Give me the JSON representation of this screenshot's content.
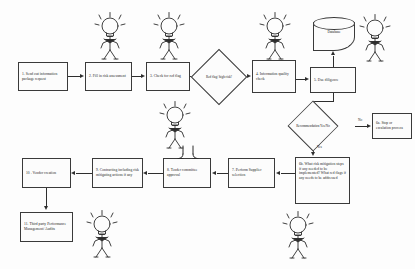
{
  "diagram": {
    "background": "#fdfdfd",
    "line_color": "#2e2e2e",
    "box_fill": "#fcfcfc",
    "nodes": [
      {
        "id": "n1",
        "label": "1. Send out information package request",
        "shape": "rect",
        "x": 18,
        "y": 62,
        "w": 50,
        "h": 29
      },
      {
        "id": "n2",
        "label": "2. Fill in risk assessment",
        "shape": "rect",
        "x": 85,
        "y": 62,
        "w": 47,
        "h": 29
      },
      {
        "id": "n3",
        "label": "3. Check for red flag",
        "shape": "rect",
        "x": 146,
        "y": 62,
        "w": 44,
        "h": 29
      },
      {
        "id": "d1",
        "label": "Red flag/ high risk?",
        "shape": "diamond",
        "x": 199,
        "y": 57,
        "w": 40,
        "h": 40
      },
      {
        "id": "n4",
        "label": "4. Information quality check",
        "shape": "rect",
        "x": 252,
        "y": 60,
        "w": 44,
        "h": 33
      },
      {
        "id": "n5",
        "label": "5. Due diligence",
        "shape": "rect",
        "x": 310,
        "y": 67,
        "w": 46,
        "h": 26
      },
      {
        "id": "db",
        "label": "Database",
        "shape": "cylinder",
        "x": 313,
        "y": 17,
        "w": 42,
        "h": 34
      },
      {
        "id": "d2",
        "label": "Recommendation Yes/No",
        "shape": "diamond",
        "x": 306,
        "y": 110,
        "w": 52,
        "h": 34
      },
      {
        "id": "n6a",
        "label": "6a. Stop or escalation process",
        "shape": "rect",
        "x": 372,
        "y": 113,
        "w": 40,
        "h": 26
      },
      {
        "id": "n6b",
        "label": "6b. What risk mitigation steps if any needed to be implemented? What red flags if any needs to be addressed",
        "shape": "rect",
        "x": 295,
        "y": 157,
        "w": 55,
        "h": 47
      },
      {
        "id": "n7",
        "label": "7. Perform Supplier selection",
        "shape": "rect",
        "x": 228,
        "y": 158,
        "w": 47,
        "h": 30
      },
      {
        "id": "n8",
        "label": "8. Tender committee approval",
        "shape": "rect",
        "x": 163,
        "y": 158,
        "w": 48,
        "h": 30
      },
      {
        "id": "n9",
        "label": "9. Contracting including risk mitigating actions if any",
        "shape": "rect",
        "x": 92,
        "y": 158,
        "w": 51,
        "h": 30
      },
      {
        "id": "n10",
        "label": "10 . Vendor creation",
        "shape": "rect",
        "x": 22,
        "y": 158,
        "w": 49,
        "h": 30
      },
      {
        "id": "n11",
        "label": "11. Third party Performance Management/ Audits",
        "shape": "rect",
        "x": 20,
        "y": 212,
        "w": 53,
        "h": 30
      }
    ],
    "edge_labels": [
      {
        "id": "yes1",
        "text": "Yes",
        "x": 320,
        "y": 146
      },
      {
        "id": "no1",
        "text": "No",
        "x": 361,
        "y": 114
      }
    ],
    "figures": [
      {
        "id": "fig-top-2",
        "x": 93,
        "y": 12,
        "w": 34,
        "h": 50
      },
      {
        "id": "fig-top-3",
        "x": 152,
        "y": 12,
        "w": 34,
        "h": 50
      },
      {
        "id": "fig-top-4",
        "x": 258,
        "y": 12,
        "w": 34,
        "h": 50
      },
      {
        "id": "fig-top-5",
        "x": 358,
        "y": 14,
        "w": 34,
        "h": 50
      },
      {
        "id": "fig-mid",
        "x": 158,
        "y": 100,
        "w": 34,
        "h": 52
      },
      {
        "id": "fig-8",
        "x": 171,
        "y": 144,
        "w": 34,
        "h": 18
      },
      {
        "id": "fig-11",
        "x": 85,
        "y": 210,
        "w": 34,
        "h": 50
      },
      {
        "id": "fig-bottom",
        "x": 281,
        "y": 211,
        "w": 34,
        "h": 50
      }
    ]
  }
}
